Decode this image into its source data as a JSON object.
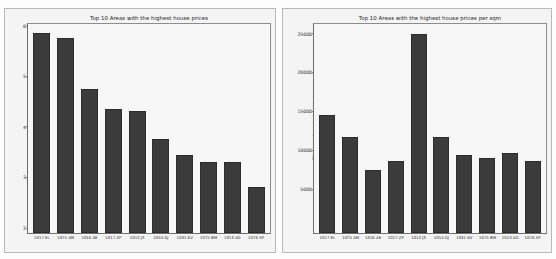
{
  "chart_data": [
    {
      "type": "bar",
      "title": "Top 10 Areas with the highest house prices",
      "xlabel": "",
      "ylabel": "House prices in millions",
      "categories": [
        "1017 EL",
        "1075 AM",
        "1016 AE",
        "1017 ZP",
        "1012 JS",
        "1054 GJ",
        "1031 KV",
        "1075 BM",
        "1013 AG",
        "1076 XP"
      ],
      "values": [
        5.95,
        5.85,
        4.85,
        4.45,
        4.42,
        3.85,
        3.55,
        3.4,
        3.4,
        2.9
      ],
      "yticks": [
        2,
        3,
        4,
        5,
        6
      ],
      "ylim": [
        2,
        6.15
      ],
      "grid": false,
      "legend": "none",
      "bar_color": "#3b3b3b"
    },
    {
      "type": "bar",
      "title": "Top 10 Areas with the highest house prices per sqm",
      "xlabel": "",
      "ylabel": "House prices per sqm",
      "categories": [
        "1017 EL",
        "1075 AM",
        "1016 AE",
        "1017 ZP",
        "1012 JS",
        "1054 GJ",
        "1031 KV",
        "1075 BM",
        "1013 AG",
        "1076 XP"
      ],
      "values": [
        15200,
        12400,
        8100,
        9200,
        25600,
        12300,
        10000,
        9600,
        10300,
        9200
      ],
      "yticks": [
        5000,
        10000,
        15000,
        20000,
        25000
      ],
      "ylim": [
        0,
        27000
      ],
      "grid": false,
      "legend": "none",
      "bar_color": "#3b3b3b"
    }
  ],
  "figures": {
    "left": {
      "name": "house-prices-total-chart",
      "title": "Top 10 Areas with the highest house prices",
      "ylabel": "House prices in millions"
    },
    "right": {
      "name": "house-prices-per-sqm-chart",
      "title": "Top 10 Areas with the highest house prices per sqm",
      "ylabel": "House prices per sqm"
    }
  }
}
